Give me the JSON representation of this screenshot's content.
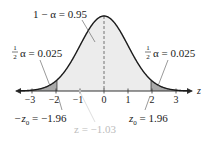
{
  "diagram": {
    "type": "normal-distribution-curve",
    "center_label": "1 − α = 0.95",
    "left_tail_label": {
      "frac_num": "1",
      "frac_den": "2",
      "text": "α = 0.025"
    },
    "right_tail_label": {
      "frac_num": "1",
      "frac_den": "2",
      "text": "α = 0.025"
    },
    "axis_variable": "z",
    "ticks": [
      "−3",
      "−2",
      "−1",
      "0",
      "1",
      "2",
      "3"
    ],
    "left_critical_label": "−z",
    "left_critical_sub": "0",
    "left_critical_value": " = −1.96",
    "right_critical_label": "z",
    "right_critical_sub": "0",
    "right_critical_value": " = 1.96",
    "test_statistic_label": "z = −1.03",
    "colors": {
      "curve": "#1a1a1a",
      "center_fill": "#ececec",
      "tail_fill": "#a9a9a9",
      "test_stat": "#bdbdbd"
    }
  }
}
